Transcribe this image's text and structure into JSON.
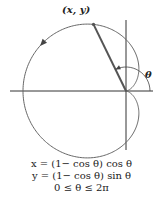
{
  "diagram": {
    "point_label": "(x, y)",
    "angle_label": "θ",
    "curve": "cardioid r = 1 − cos θ",
    "equations": [
      "x = (1− cos θ) cos θ",
      "y = (1− cos θ) sin θ",
      "0 ≤ θ ≤ 2π"
    ],
    "colors": {
      "curve": "#666666",
      "axes": "#333333",
      "radius": "#555555"
    }
  }
}
